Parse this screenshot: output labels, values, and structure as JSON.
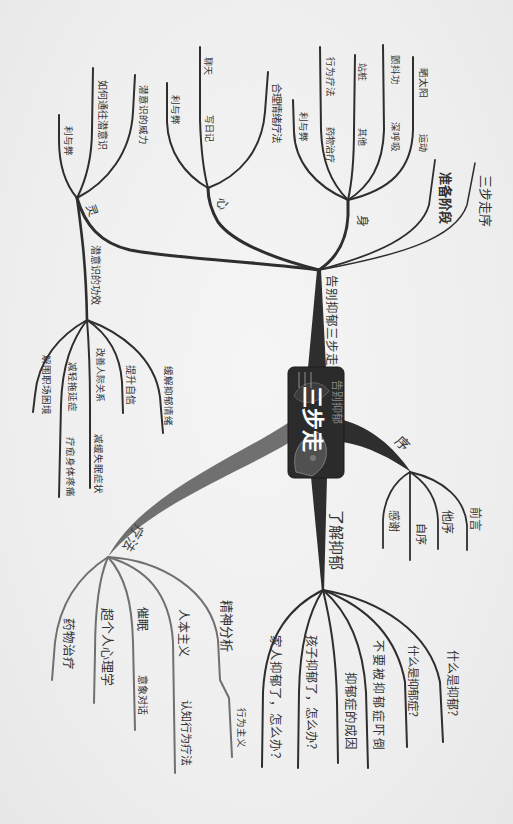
{
  "colors": {
    "bg": "#efefef",
    "line": "#2e2e2e",
    "therapy": "#707070",
    "box": "#2b2b2b",
    "text": "#333333",
    "subtle": "#8a8a8a"
  },
  "map": {
    "center": {
      "title": "三步走",
      "subtitle": "告别抑郁"
    },
    "branches": [
      {
        "label": "告别抑郁三步走",
        "children": [
          {
            "label": "灵",
            "children": [
              {
                "label": "利与弊"
              },
              {
                "label": "如何通往潜意识"
              },
              {
                "label": "潜意识的威力"
              },
              {
                "label": "潜意识的功效",
                "children": [
                  {
                    "label": "解围职场困境"
                  },
                  {
                    "label": "减轻拖延症",
                    "children": [
                      {
                        "label": "疗愈身体疼痛"
                      }
                    ]
                  },
                  {
                    "label": "改善人际关系",
                    "children": [
                      {
                        "label": "减缓失眠症状"
                      }
                    ]
                  },
                  {
                    "label": "提升自信"
                  },
                  {
                    "label": "缓解抑郁情绪"
                  }
                ]
              }
            ]
          },
          {
            "label": "心",
            "children": [
              {
                "label": "利与弊"
              },
              {
                "label": "写日记",
                "children": [
                  {
                    "label": "聊天"
                  }
                ]
              },
              {
                "label": "合理情绪疗法"
              }
            ]
          },
          {
            "label": "身",
            "children": [
              {
                "label": "利与弊"
              },
              {
                "label": "药物治疗",
                "children": [
                  {
                    "label": "行为疗法"
                  }
                ]
              },
              {
                "label": "其他",
                "children": [
                  {
                    "label": "站桩"
                  }
                ]
              },
              {
                "label": "深呼吸",
                "children": [
                  {
                    "label": "颤抖功"
                  }
                ]
              },
              {
                "label": "运动",
                "children": [
                  {
                    "label": "晒太阳"
                  }
                ]
              }
            ]
          },
          {
            "label": "准备阶段"
          },
          {
            "label": "三步走序"
          }
        ]
      },
      {
        "label": "序",
        "children": [
          {
            "label": "感谢"
          },
          {
            "label": "自序"
          },
          {
            "label": "他序"
          },
          {
            "label": "前言"
          }
        ]
      },
      {
        "label": "了解抑郁",
        "children": [
          {
            "label": "家人抑郁了，怎么办？"
          },
          {
            "label": "孩子抑郁了，怎么办？"
          },
          {
            "label": "抑郁症的成因"
          },
          {
            "label": "不要被抑郁症吓倒"
          },
          {
            "label": "什么是抑郁症？"
          },
          {
            "label": "什么是抑郁？"
          }
        ]
      },
      {
        "label": "疗法",
        "children": [
          {
            "label": "药物治疗"
          },
          {
            "label": "超个人心理学"
          },
          {
            "label": "催眠",
            "children": [
              {
                "label": "意象对话"
              }
            ]
          },
          {
            "label": "人本主义",
            "children": [
              {
                "label": "认知行为疗法"
              }
            ]
          },
          {
            "label": "精神分析",
            "children": [
              {
                "label": "行为主义"
              }
            ]
          }
        ]
      }
    ]
  }
}
